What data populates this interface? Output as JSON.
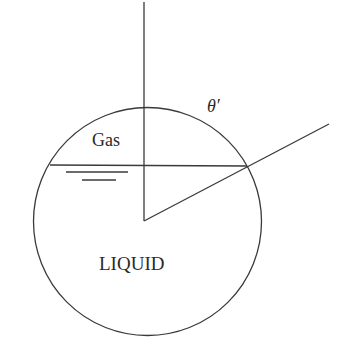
{
  "diagram": {
    "type": "gas-liquid interface in a spherical container with contact angle",
    "labels": {
      "gas": "Gas",
      "liquid": "LIQUID",
      "angle": "θ′"
    },
    "colors": {
      "line": "#3a3a3a",
      "text": "#2a2a2a",
      "background": "#ffffff"
    }
  }
}
